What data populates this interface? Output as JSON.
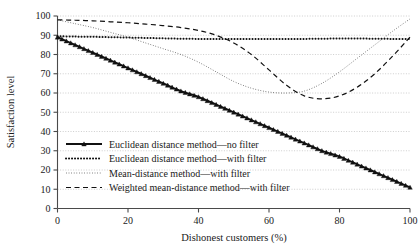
{
  "chart_data": {
    "type": "line",
    "title": "",
    "xlabel": "Dishonest customers (%)",
    "ylabel": "Satisfaction level",
    "xlim": [
      0,
      100
    ],
    "ylim": [
      0,
      100
    ],
    "xticks": [
      0,
      20,
      40,
      60,
      80,
      100
    ],
    "yticks": [
      0,
      10,
      20,
      30,
      40,
      50,
      60,
      70,
      80,
      90,
      100
    ],
    "grid": true,
    "legend_position": "lower-left-inside",
    "x": [
      0,
      5,
      10,
      15,
      20,
      25,
      30,
      35,
      40,
      45,
      50,
      55,
      60,
      65,
      70,
      75,
      80,
      85,
      90,
      95,
      100
    ],
    "series": [
      {
        "name": "Euclidean distance method—no filter",
        "style": "solid-with-triangle-markers",
        "values": [
          89,
          85,
          81,
          77,
          73,
          69,
          65,
          61,
          58,
          54,
          50,
          46,
          42,
          38,
          34,
          30,
          27,
          23,
          19,
          15,
          11
        ]
      },
      {
        "name": "Euclidean distance method—with filter",
        "style": "thick-dotted",
        "values": [
          89.5,
          89.3,
          89.2,
          89.0,
          88.8,
          88.6,
          88.4,
          88.2,
          88.1,
          88.0,
          88.0,
          88.0,
          88.0,
          88.0,
          88.1,
          88.2,
          88.3,
          88.3,
          88.2,
          88.1,
          88.0
        ]
      },
      {
        "name": "Mean-distance method—with filter",
        "style": "fine-dotted",
        "values": [
          98,
          96,
          94,
          91.5,
          89,
          86,
          83,
          80,
          76,
          71,
          66,
          62.5,
          60.5,
          60,
          61,
          65,
          71,
          78,
          85,
          92,
          98.5
        ]
      },
      {
        "name": "Weighted mean-distance method—with filter",
        "style": "dashed",
        "values": [
          98,
          97.8,
          97.5,
          97,
          96.5,
          95.8,
          95,
          94,
          92.5,
          90,
          86,
          80,
          72,
          64,
          58.5,
          57,
          58.5,
          63,
          70,
          79,
          89
        ]
      }
    ]
  },
  "legend": {
    "items": [
      {
        "label": "Euclidean distance method—no filter"
      },
      {
        "label": "Euclidean distance method—with filter"
      },
      {
        "label": "Mean-distance method—with filter"
      },
      {
        "label": "Weighted mean-distance method—with filter"
      }
    ]
  },
  "axes": {
    "y_title": "Satisfaction level",
    "x_title": "Dishonest customers (%)",
    "y_tick_labels": [
      "100",
      "90",
      "80",
      "70",
      "60",
      "50",
      "40",
      "30",
      "20",
      "10",
      "0"
    ],
    "x_tick_labels": [
      "0",
      "20",
      "40",
      "60",
      "80",
      "100"
    ]
  },
  "colors": {
    "ink": "#1a1a1a",
    "grid": "#b9b9b9",
    "axis": "#4a4a4a",
    "background": "#ffffff"
  }
}
